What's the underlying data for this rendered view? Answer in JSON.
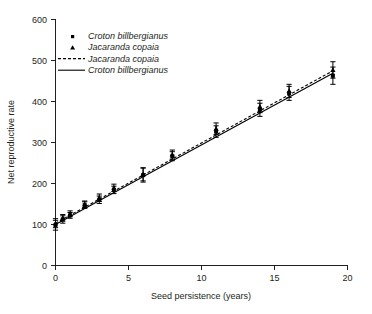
{
  "chart_data": {
    "type": "scatter",
    "title": "",
    "xlabel": "Seed persistence (years)",
    "ylabel": "Net reproductive rate",
    "xlim": [
      0,
      20
    ],
    "ylim": [
      0,
      600
    ],
    "xticks": [
      0,
      5,
      10,
      15,
      20
    ],
    "yticks": [
      0,
      100,
      200,
      300,
      400,
      500,
      600
    ],
    "xtick_labels": [
      "0",
      "5",
      "10",
      "15",
      "20"
    ],
    "ytick_labels": [
      "0",
      "100",
      "200",
      "300",
      "400",
      "500",
      "600"
    ],
    "grid": false,
    "legend_position": "top-left",
    "legend": [
      {
        "label": "Croton billbergianus",
        "marker": "square",
        "style": "marker"
      },
      {
        "label": "Jacaranda copaia",
        "marker": "triangle",
        "style": "marker"
      },
      {
        "label": "Jacaranda copaia",
        "marker": "none",
        "style": "dashed-line"
      },
      {
        "label": "Croton billbergianus",
        "marker": "none",
        "style": "solid-line"
      }
    ],
    "series": [
      {
        "name": "Croton billbergianus",
        "marker": "square",
        "x": [
          0,
          0.5,
          1,
          2,
          3,
          4,
          6,
          8,
          11,
          14,
          16,
          19
        ],
        "y": [
          98,
          112,
          122,
          147,
          160,
          184,
          220,
          266,
          326,
          379,
          419,
          462
        ],
        "yerr": [
          12,
          9,
          7,
          8,
          9,
          9,
          17,
          11,
          14,
          16,
          17,
          21
        ]
      },
      {
        "name": "Jacaranda copaia",
        "marker": "triangle",
        "x": [
          0,
          0.5,
          1,
          2,
          3,
          4,
          6,
          8,
          11,
          14,
          16,
          19
        ],
        "y": [
          103,
          116,
          126,
          149,
          165,
          189,
          222,
          270,
          333,
          387,
          425,
          476
        ],
        "yerr": [
          11,
          8,
          7,
          8,
          9,
          9,
          16,
          11,
          14,
          15,
          16,
          20
        ]
      }
    ],
    "fit_lines": [
      {
        "name": "Croton billbergianus",
        "style": "solid",
        "x": [
          0,
          19
        ],
        "y": [
          100,
          468
        ]
      },
      {
        "name": "Jacaranda copaia",
        "style": "dashed",
        "x": [
          0,
          19
        ],
        "y": [
          103,
          474
        ]
      }
    ]
  }
}
